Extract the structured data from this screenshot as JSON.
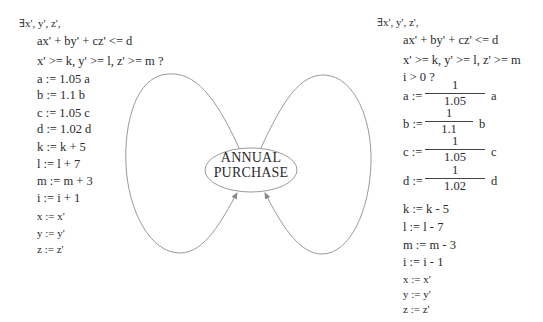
{
  "diagram": {
    "node": {
      "line1": "ANNUAL",
      "line2": "PURCHASE"
    },
    "left_transition": {
      "guard": {
        "quantifier": "∃x', y', z',",
        "constraint1": "ax' + by' + cz' <= d",
        "constraint2": "x' >= k, y' >= l, z' >= m ?"
      },
      "updates": [
        "a := 1.05 a",
        "b := 1.1 b",
        "c := 1.05 c",
        "d := 1.02 d",
        "k := k + 5",
        "l := l + 7",
        "m := m + 3",
        "i := i + 1",
        "x := x'",
        "y := y'",
        "z := z'"
      ]
    },
    "right_transition": {
      "guard": {
        "quantifier": "∃x', y', z',",
        "constraint1": "ax' + by' + cz' <= d",
        "constraint2": "x' >= k, y' >= l, z' >= m",
        "constraint3": "i > 0 ?"
      },
      "fraction_updates": [
        {
          "lhs": "a :=",
          "num": "1",
          "den": "1.05",
          "rhs": "a"
        },
        {
          "lhs": "b :=",
          "num": "1",
          "den": "1.1",
          "rhs": "b"
        },
        {
          "lhs": "c :=",
          "num": "1",
          "den": "1.05",
          "rhs": "c"
        },
        {
          "lhs": "d :=",
          "num": "1",
          "den": "1.02",
          "rhs": "d"
        }
      ],
      "updates": [
        "k := k - 5",
        "l := l - 7",
        "m := m - 3",
        "i := i - 1",
        "x := x'",
        "y := y'",
        "z := z'"
      ]
    },
    "colors": {
      "stroke": "#9a9a9a",
      "text": "#2a2a2a"
    }
  }
}
